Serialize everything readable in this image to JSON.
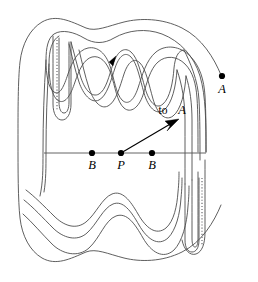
{
  "figure": {
    "background_color": "#ffffff",
    "curve_color": "#4d4d4d",
    "accent_color": "#000000",
    "width": 258,
    "height": 282
  },
  "labels": {
    "point_a": "A",
    "point_b_left": "B",
    "point_p": "P",
    "point_b_right": "B",
    "arrow_annotation_prefix": "to",
    "arrow_annotation_target": "A"
  },
  "points": {
    "a": {
      "label": "A",
      "x": 222,
      "y": 76
    },
    "b_left": {
      "label": "B",
      "x": 92,
      "y": 153
    },
    "p": {
      "label": "P",
      "x": 121,
      "y": 153
    },
    "b_right": {
      "label": "B",
      "x": 152,
      "y": 153
    }
  },
  "arrow": {
    "label": "to A",
    "from_x": 121,
    "from_y": 153,
    "to_x": 177,
    "to_y": 120
  },
  "axis": {
    "x_start": 44,
    "x_end": 206,
    "y": 153
  },
  "annotations": {
    "direction_marker": "tangent-arrowhead"
  }
}
